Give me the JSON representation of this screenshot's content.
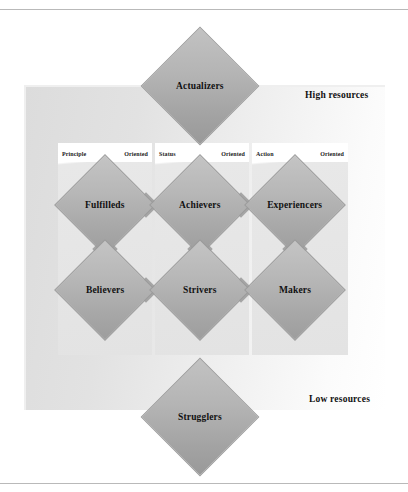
{
  "diagram": {
    "resources_axis": {
      "high_label": "High resources",
      "low_label": "Low resources"
    },
    "orientations": [
      {
        "id": "principle",
        "left_word": "Principle",
        "right_word": "Oriented"
      },
      {
        "id": "status",
        "left_word": "Status",
        "right_word": "Oriented"
      },
      {
        "id": "action",
        "left_word": "Action",
        "right_word": "Oriented"
      }
    ],
    "segments": {
      "top_pole": {
        "label": "Actualizers"
      },
      "bottom_pole": {
        "label": "Strugglers"
      },
      "upper_row": [
        {
          "label": "Fulfilleds",
          "orientation": "principle"
        },
        {
          "label": "Achievers",
          "orientation": "status"
        },
        {
          "label": "Experiencers",
          "orientation": "action"
        }
      ],
      "lower_row": [
        {
          "label": "Believers",
          "orientation": "principle"
        },
        {
          "label": "Strivers",
          "orientation": "status"
        },
        {
          "label": "Makers",
          "orientation": "action"
        }
      ]
    },
    "colors": {
      "diamond_fill": "#a8a8a8",
      "diamond_border": "#9c9c9c",
      "panel_background": "#e2e2e2",
      "column_background": "#e3e3e3",
      "text": "#111111",
      "page_rule": "#b9b9b9"
    }
  }
}
